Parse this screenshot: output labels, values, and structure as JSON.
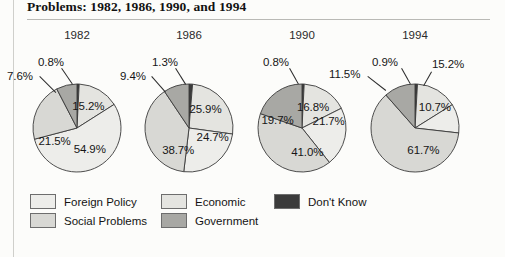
{
  "page": {
    "title": "Problems: 1982, 1986, 1990, and 1994"
  },
  "legend": {
    "columns": [
      {
        "items": [
          {
            "label": "Foreign Policy",
            "color": "#ededea"
          },
          {
            "label": "Social Problems",
            "color": "#d8d8d4"
          }
        ]
      },
      {
        "items": [
          {
            "label": "Economic",
            "color": "#e4e4e0"
          },
          {
            "label": "Government",
            "color": "#a8a8a4"
          }
        ]
      },
      {
        "items": [
          {
            "label": "Don't Know",
            "color": "#3b3b3b"
          }
        ]
      }
    ]
  },
  "chart_data": {
    "type": "pie",
    "title": "Problems: 1982, 1986, 1990, and 1994",
    "xlabel": "",
    "ylabel": "",
    "legend_position": "bottom",
    "grid": false,
    "categories": [
      "Don't Know",
      "Economic",
      "Foreign Policy",
      "Social Problems",
      "Government"
    ],
    "colors": [
      "#3b3b3b",
      "#e4e4e0",
      "#ededea",
      "#d8d8d4",
      "#a8a8a4"
    ],
    "charts": [
      {
        "title": "1982",
        "slices": [
          {
            "label": "Don't Know",
            "value": 0.8,
            "display": "0.8%",
            "color": "#3b3b3b"
          },
          {
            "label": "Economic",
            "value": 15.2,
            "display": "15.2%",
            "color": "#e4e4e0"
          },
          {
            "label": "Foreign Policy",
            "value": 54.9,
            "display": "54.9%",
            "color": "#ededea"
          },
          {
            "label": "Social Problems",
            "value": 21.5,
            "display": "21.5%",
            "color": "#d8d8d4"
          },
          {
            "label": "Government",
            "value": 7.6,
            "display": "7.6%",
            "color": "#a8a8a4"
          }
        ]
      },
      {
        "title": "1986",
        "slices": [
          {
            "label": "Don't Know",
            "value": 1.3,
            "display": "1.3%",
            "color": "#3b3b3b"
          },
          {
            "label": "Economic",
            "value": 25.9,
            "display": "25.9%",
            "color": "#e4e4e0"
          },
          {
            "label": "Foreign Policy",
            "value": 24.7,
            "display": "24.7%",
            "color": "#ededea"
          },
          {
            "label": "Social Problems",
            "value": 38.7,
            "display": "38.7%",
            "color": "#d8d8d4"
          },
          {
            "label": "Government",
            "value": 9.4,
            "display": "9.4%",
            "color": "#a8a8a4"
          }
        ]
      },
      {
        "title": "1990",
        "slices": [
          {
            "label": "Don't Know",
            "value": 0.8,
            "display": "0.8%",
            "color": "#3b3b3b"
          },
          {
            "label": "Economic",
            "value": 16.8,
            "display": "16.8%",
            "color": "#e4e4e0"
          },
          {
            "label": "Foreign Policy",
            "value": 21.7,
            "display": "21.7%",
            "color": "#ededea"
          },
          {
            "label": "Social Problems",
            "value": 41.0,
            "display": "41.0%",
            "color": "#d8d8d4"
          },
          {
            "label": "Government",
            "value": 19.7,
            "display": "19.7%",
            "color": "#a8a8a4"
          }
        ]
      },
      {
        "title": "1994",
        "slices": [
          {
            "label": "Don't Know",
            "value": 0.9,
            "display": "0.9%",
            "color": "#3b3b3b"
          },
          {
            "label": "Economic",
            "value": 15.2,
            "display": "15.2%",
            "color": "#e4e4e0"
          },
          {
            "label": "Foreign Policy",
            "value": 10.7,
            "display": "10.7%",
            "color": "#ededea"
          },
          {
            "label": "Social Problems",
            "value": 61.7,
            "display": "61.7%",
            "color": "#d8d8d4"
          },
          {
            "label": "Government",
            "value": 11.5,
            "display": "11.5%",
            "color": "#a8a8a4"
          }
        ]
      }
    ]
  }
}
